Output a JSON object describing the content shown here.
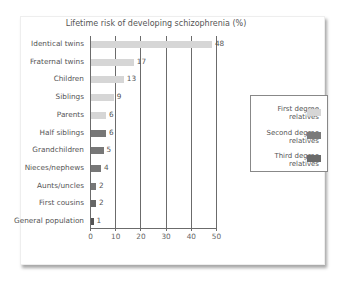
{
  "chart_data": {
    "type": "bar",
    "orientation": "horizontal",
    "title": "Lifetime risk of developing schizophrenia (%)",
    "xlabel": "",
    "ylabel": "",
    "xlim": [
      0,
      50
    ],
    "xticks": [
      0,
      10,
      20,
      30,
      40,
      50
    ],
    "grid": "vertical",
    "legend_position": "right",
    "categories": [
      "Identical twins",
      "Fraternal twins",
      "Children",
      "Siblings",
      "Parents",
      "Half siblings",
      "Grandchildren",
      "Nieces/nephews",
      "Aunts/uncles",
      "First cousins",
      "General population"
    ],
    "values": [
      48,
      17,
      13,
      9,
      6,
      6,
      5,
      4,
      2,
      2,
      1
    ],
    "groups": [
      "first",
      "first",
      "first",
      "first",
      "first",
      "second",
      "second",
      "second",
      "second",
      "third",
      "none"
    ],
    "legend": [
      {
        "key": "first",
        "label_line1": "First degree",
        "label_line2": "relatives",
        "color": "#d6d6d6"
      },
      {
        "key": "second",
        "label_line1": "Second degree",
        "label_line2": "relatives",
        "color": "#7a7a7a"
      },
      {
        "key": "third",
        "label_line1": "Third degree",
        "label_line2": "relatives",
        "color": "#6a6a6a"
      }
    ],
    "colors": {
      "first": "#d6d6d6",
      "second": "#777777",
      "third": "#666666",
      "none": "#555555"
    }
  }
}
